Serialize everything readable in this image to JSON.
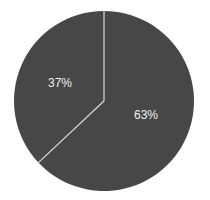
{
  "chart_data": {
    "type": "pie",
    "title": "",
    "categories": [
      "Slice A",
      "Slice B"
    ],
    "values": [
      37,
      63
    ],
    "labels": [
      "37%",
      "63%"
    ],
    "start_angle_deg": 0,
    "direction": "counterclockwise-for-first-slice",
    "legend": null
  },
  "colors": {
    "slice_fill": "#474747",
    "divider": "#d9d9d9",
    "label_text": "#f0f0f0",
    "background": "#ffffff"
  },
  "geometry": {
    "cx": 104,
    "cy": 101,
    "r": 90
  }
}
